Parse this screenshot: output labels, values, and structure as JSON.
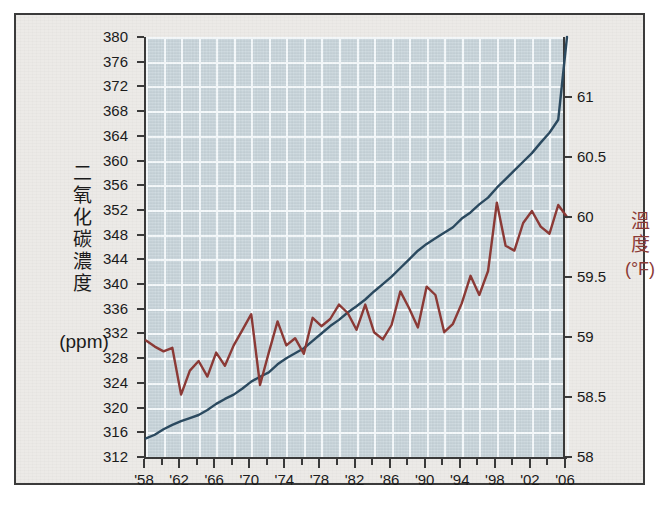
{
  "chart_data": {
    "type": "line",
    "title": "",
    "grid": true,
    "legend_position": "none",
    "xlabel": "",
    "x_tick_labels": [
      "'58",
      "'62",
      "'66",
      "'70",
      "'74",
      "'78",
      "'82",
      "'86",
      "'90",
      "'94",
      "'98",
      "'02",
      "'06"
    ],
    "x_major_years": [
      1958,
      1962,
      1966,
      1970,
      1974,
      1978,
      1982,
      1986,
      1990,
      1994,
      1998,
      2002,
      2006
    ],
    "x_minor_step_years": 2,
    "xlim": [
      1958,
      2006
    ],
    "left_axis": {
      "label_vertical": "二氧化碳濃度",
      "label_unit": "(ppm)",
      "ylim": [
        312,
        380
      ],
      "tick_step": 4,
      "ticks": [
        312,
        316,
        320,
        324,
        328,
        332,
        336,
        340,
        344,
        348,
        352,
        356,
        360,
        364,
        368,
        372,
        376,
        380
      ],
      "color": "#2b4a60"
    },
    "right_axis": {
      "label_vertical": "溫度",
      "label_unit": "(°F)",
      "ylim": [
        58,
        61.5
      ],
      "tick_step": 0.5,
      "ticks": [
        58,
        58.5,
        59,
        59.5,
        60,
        60.5,
        61
      ],
      "color": "#8c3a36"
    },
    "series": [
      {
        "name": "二氧化碳濃度",
        "axis": "left",
        "color": "#2b4a60",
        "x": [
          1958,
          1959,
          1960,
          1961,
          1962,
          1963,
          1964,
          1965,
          1966,
          1967,
          1968,
          1969,
          1970,
          1971,
          1972,
          1973,
          1974,
          1975,
          1976,
          1977,
          1978,
          1979,
          1980,
          1981,
          1982,
          1983,
          1984,
          1985,
          1986,
          1987,
          1988,
          1989,
          1990,
          1991,
          1992,
          1993,
          1994,
          1995,
          1996,
          1997,
          1998,
          1999,
          2000,
          2001,
          2002,
          2003,
          2004,
          2005,
          2006
        ],
        "values": [
          315.0,
          315.6,
          316.5,
          317.2,
          317.8,
          318.3,
          318.8,
          319.6,
          320.6,
          321.4,
          322.1,
          323.1,
          324.2,
          325.0,
          325.7,
          327.0,
          328.0,
          328.8,
          329.6,
          330.8,
          332.0,
          333.2,
          334.2,
          335.4,
          336.4,
          337.5,
          338.8,
          340.0,
          341.2,
          342.6,
          344.0,
          345.4,
          346.5,
          347.4,
          348.3,
          349.2,
          350.6,
          351.6,
          352.9,
          354.0,
          355.6,
          357.0,
          358.4,
          359.8,
          361.2,
          362.9,
          364.5,
          366.6,
          380.0
        ]
      },
      {
        "name": "溫度",
        "axis": "right",
        "color": "#8c3a36",
        "x": [
          1958,
          1959,
          1960,
          1961,
          1962,
          1963,
          1964,
          1965,
          1966,
          1967,
          1968,
          1969,
          1970,
          1971,
          1972,
          1973,
          1974,
          1975,
          1976,
          1977,
          1978,
          1979,
          1980,
          1981,
          1982,
          1983,
          1984,
          1985,
          1986,
          1987,
          1988,
          1989,
          1990,
          1991,
          1992,
          1993,
          1994,
          1995,
          1996,
          1997,
          1998,
          1999,
          2000,
          2001,
          2002,
          2003,
          2004,
          2005,
          2006
        ],
        "values": [
          58.97,
          58.92,
          58.88,
          58.91,
          58.52,
          58.72,
          58.8,
          58.67,
          58.87,
          58.76,
          58.93,
          59.06,
          59.19,
          58.6,
          58.87,
          59.13,
          58.93,
          58.99,
          58.86,
          59.16,
          59.09,
          59.15,
          59.27,
          59.2,
          59.06,
          59.27,
          59.04,
          58.98,
          59.1,
          59.38,
          59.24,
          59.08,
          59.42,
          59.35,
          59.04,
          59.11,
          59.28,
          59.51,
          59.35,
          59.55,
          60.12,
          59.76,
          59.72,
          59.95,
          60.05,
          59.92,
          59.86,
          60.1,
          60.0
        ]
      }
    ]
  }
}
